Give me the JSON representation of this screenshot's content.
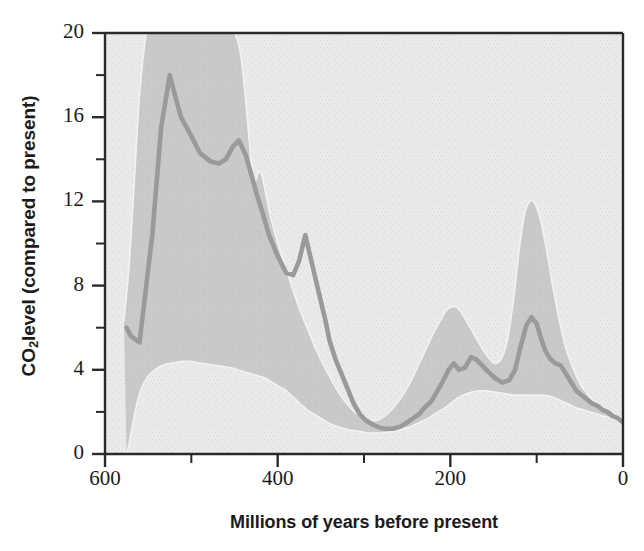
{
  "chart_data": {
    "type": "area",
    "title": "",
    "xlabel": "Millions of years before present",
    "ylabel": "CO2 level (compared to present)",
    "ylabel_parts": {
      "pre": "CO",
      "sub": "2",
      "post": " level (compared to present)"
    },
    "xlim": [
      600,
      0
    ],
    "ylim": [
      0,
      20
    ],
    "x_reversed": true,
    "grid": false,
    "legend": "none",
    "x_ticks_major": [
      600,
      400,
      200,
      0
    ],
    "x_ticks_major_labels": [
      "600",
      "400",
      "200",
      "0"
    ],
    "x_ticks_minor": [
      500,
      300,
      100
    ],
    "y_ticks_major": [
      0,
      4,
      8,
      12,
      16,
      20
    ],
    "y_ticks_major_labels": [
      "0",
      "4",
      "8",
      "12",
      "16",
      "20"
    ],
    "y_ticks_minor": [
      2,
      6,
      10,
      14,
      18
    ],
    "colors": {
      "band_fill": "#c9c9c9",
      "background_fill": "#e8e8e8",
      "best_estimate_line": "#9a9a9a",
      "axis": "#2a2a2a",
      "text": "#1b1b1b"
    },
    "series": [
      {
        "name": "Best estimate",
        "x": [
          575,
          570,
          560,
          545,
          535,
          525,
          520,
          512,
          500,
          490,
          478,
          468,
          460,
          452,
          445,
          437,
          430,
          424,
          417,
          410,
          400,
          390,
          382,
          375,
          368,
          360,
          352,
          345,
          340,
          333,
          325,
          318,
          312,
          305,
          298,
          290,
          282,
          274,
          266,
          258,
          250,
          243,
          236,
          230,
          222,
          215,
          208,
          202,
          196,
          190,
          183,
          176,
          170,
          163,
          156,
          148,
          140,
          132,
          125,
          118,
          112,
          106,
          100,
          95,
          90,
          84,
          78,
          72,
          66,
          60,
          54,
          48,
          42,
          36,
          30,
          24,
          18,
          12,
          6,
          0
        ],
        "values": [
          6.0,
          5.6,
          5.3,
          10.5,
          15.5,
          18.0,
          17.2,
          16.0,
          15.1,
          14.3,
          13.9,
          13.8,
          14.0,
          14.6,
          14.9,
          14.2,
          13.2,
          12.3,
          11.4,
          10.4,
          9.4,
          8.6,
          8.5,
          9.2,
          10.4,
          9.0,
          7.6,
          6.4,
          5.4,
          4.5,
          3.7,
          3.0,
          2.4,
          1.9,
          1.6,
          1.4,
          1.25,
          1.2,
          1.2,
          1.3,
          1.5,
          1.7,
          1.9,
          2.2,
          2.5,
          3.0,
          3.5,
          4.0,
          4.3,
          4.0,
          4.1,
          4.6,
          4.5,
          4.2,
          3.9,
          3.6,
          3.4,
          3.5,
          4.0,
          5.2,
          6.1,
          6.5,
          6.2,
          5.5,
          4.9,
          4.5,
          4.3,
          4.2,
          3.8,
          3.4,
          3.0,
          2.8,
          2.6,
          2.4,
          2.3,
          2.1,
          2.0,
          1.8,
          1.7,
          1.5
        ]
      },
      {
        "name": "Upper bound",
        "x": [
          578,
          572,
          566,
          560,
          552,
          545,
          538,
          530,
          520,
          508,
          496,
          484,
          472,
          460,
          450,
          443,
          438,
          434,
          430,
          426,
          422,
          418,
          414,
          410,
          404,
          396,
          388,
          380,
          372,
          364,
          356,
          348,
          340,
          332,
          324,
          316,
          308,
          300,
          292,
          284,
          276,
          268,
          260,
          252,
          244,
          236,
          228,
          220,
          212,
          205,
          198,
          191,
          184,
          177,
          170,
          163,
          156,
          148,
          140,
          133,
          126,
          120,
          114,
          108,
          102,
          96,
          90,
          84,
          78,
          72,
          66,
          60,
          54,
          48,
          42,
          36,
          30,
          24,
          18,
          12,
          6,
          0
        ],
        "values": [
          6.3,
          9.0,
          13.0,
          17.0,
          20.0,
          20.0,
          20.0,
          20.0,
          20.0,
          20.0,
          20.0,
          20.0,
          20.0,
          20.0,
          20.0,
          19.0,
          17.2,
          15.4,
          13.6,
          13.0,
          13.4,
          13.2,
          12.4,
          11.6,
          10.6,
          9.5,
          8.5,
          7.5,
          6.6,
          5.8,
          5.0,
          4.3,
          3.7,
          3.1,
          2.6,
          2.2,
          1.9,
          1.7,
          1.6,
          1.6,
          1.8,
          2.1,
          2.5,
          3.0,
          3.6,
          4.3,
          5.0,
          5.7,
          6.3,
          6.8,
          7.0,
          6.9,
          6.5,
          6.0,
          5.5,
          5.0,
          4.6,
          4.3,
          4.6,
          5.6,
          7.6,
          9.8,
          11.4,
          12.0,
          11.9,
          11.2,
          10.0,
          8.6,
          7.2,
          6.0,
          5.0,
          4.3,
          3.7,
          3.2,
          2.9,
          2.6,
          2.4,
          2.2,
          2.0,
          1.9,
          1.8,
          1.7
        ]
      },
      {
        "name": "Lower bound",
        "x": [
          575,
          572,
          568,
          563,
          557,
          550,
          542,
          534,
          526,
          518,
          510,
          502,
          494,
          486,
          478,
          470,
          462,
          454,
          446,
          438,
          430,
          422,
          414,
          406,
          398,
          390,
          382,
          374,
          366,
          358,
          350,
          342,
          334,
          326,
          318,
          310,
          302,
          294,
          286,
          278,
          270,
          262,
          254,
          246,
          238,
          230,
          222,
          214,
          206,
          198,
          190,
          182,
          174,
          166,
          158,
          150,
          142,
          134,
          126,
          118,
          110,
          102,
          94,
          86,
          78,
          70,
          62,
          54,
          46,
          38,
          30,
          22,
          14,
          7,
          0
        ],
        "values": [
          0.0,
          0.5,
          1.4,
          2.4,
          3.2,
          3.7,
          4.0,
          4.2,
          4.3,
          4.35,
          4.4,
          4.4,
          4.35,
          4.3,
          4.25,
          4.2,
          4.15,
          4.1,
          4.0,
          3.9,
          3.8,
          3.7,
          3.6,
          3.4,
          3.2,
          3.0,
          2.7,
          2.4,
          2.1,
          1.9,
          1.7,
          1.5,
          1.35,
          1.25,
          1.15,
          1.1,
          1.05,
          1.0,
          1.0,
          1.0,
          1.05,
          1.1,
          1.2,
          1.3,
          1.45,
          1.6,
          1.8,
          2.0,
          2.2,
          2.45,
          2.7,
          2.85,
          2.95,
          3.0,
          3.0,
          2.95,
          2.9,
          2.85,
          2.8,
          2.8,
          2.8,
          2.8,
          2.8,
          2.75,
          2.65,
          2.5,
          2.35,
          2.2,
          2.1,
          2.0,
          1.9,
          1.8,
          1.7,
          1.6,
          1.5
        ]
      }
    ],
    "annotations": [
      {
        "text": "Band is clipped at the top of the axis (20) between roughly 555 and 440 million years before present."
      }
    ]
  }
}
